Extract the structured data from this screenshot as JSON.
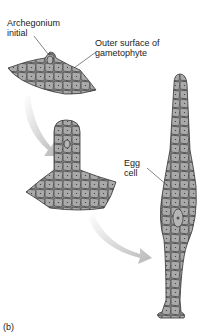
{
  "figure": {
    "panel_label": "(b)",
    "labels": {
      "archegonium_initial": [
        "Archegonium",
        "initial"
      ],
      "outer_surface": [
        "Outer surface of",
        "gametophyte"
      ],
      "egg_cell": [
        "Egg",
        "cell"
      ]
    },
    "colors": {
      "cell_fill": "#a9a9a9",
      "cell_line": "#333333",
      "arrow": "#c8c8c8"
    }
  }
}
